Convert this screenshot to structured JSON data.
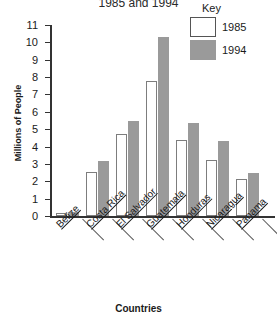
{
  "chart_data": {
    "type": "bar",
    "title": "1985 and 1994",
    "xlabel": "Countries",
    "ylabel": "Millions of People",
    "categories": [
      "Belize",
      "Costa Rica",
      "El Salvador",
      "Guatemala",
      "Honduras",
      "Nicaragua",
      "Panama"
    ],
    "series": [
      {
        "name": "1985",
        "color": "#ffffff",
        "values": [
          0.15,
          2.55,
          4.7,
          7.75,
          4.35,
          3.25,
          2.15
        ]
      },
      {
        "name": "1994",
        "color": "#9a9a9a",
        "values": [
          0.25,
          3.15,
          5.45,
          10.3,
          5.35,
          4.3,
          2.5
        ]
      }
    ],
    "ylim": [
      0,
      11
    ],
    "yticks": [
      "0",
      "1",
      "2",
      "3",
      "4",
      "5",
      "6",
      "7",
      "8",
      "9",
      "10",
      "11"
    ],
    "grid": false,
    "legend": {
      "title": "Key",
      "position": "top-right"
    }
  }
}
